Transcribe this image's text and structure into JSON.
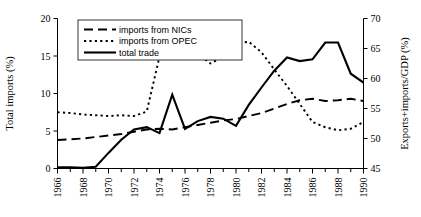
{
  "chart_data": {
    "type": "line",
    "title": "",
    "xlabel": "",
    "ylabel": "Total imports (%)",
    "y2label": "Exports+imports/GDP (%)",
    "grid": false,
    "legend_position": "top-center",
    "x": [
      1966,
      1967,
      1968,
      1969,
      1970,
      1971,
      1972,
      1973,
      1974,
      1975,
      1976,
      1977,
      1978,
      1979,
      1980,
      1981,
      1982,
      1983,
      1984,
      1985,
      1986,
      1987,
      1988,
      1989,
      1990
    ],
    "xlim": [
      1966,
      1990
    ],
    "xticks": [
      1966,
      1968,
      1970,
      1972,
      1974,
      1976,
      1978,
      1980,
      1982,
      1984,
      1986,
      1988,
      1990
    ],
    "xticklabels": [
      "1966",
      "1968",
      "1970",
      "1972",
      "1974",
      "1976",
      "1978",
      "1980",
      "1982",
      "1984",
      "1986",
      "1988",
      "1990"
    ],
    "ylim": [
      0,
      20
    ],
    "yticks": [
      0,
      5,
      10,
      15,
      20
    ],
    "yticklabels": [
      "0",
      "5",
      "10",
      "15",
      "20"
    ],
    "y2lim": [
      45,
      70
    ],
    "y2ticks": [
      45,
      50,
      55,
      60,
      65,
      70
    ],
    "y2ticklabels": [
      "45",
      "50",
      "55",
      "60",
      "65",
      "70"
    ],
    "series": [
      {
        "name": "imports from NICs",
        "style": "dashed",
        "axis": "left",
        "values": [
          3.8,
          3.9,
          4.0,
          4.2,
          4.4,
          4.6,
          4.9,
          5.2,
          5.3,
          5.2,
          5.5,
          5.8,
          6.1,
          6.4,
          6.6,
          7.0,
          7.4,
          8.0,
          8.6,
          9.1,
          9.3,
          9.0,
          9.1,
          9.3,
          9.0
        ]
      },
      {
        "name": "imports from OPEC",
        "style": "dotted",
        "axis": "left",
        "values": [
          7.5,
          7.4,
          7.2,
          7.1,
          7.0,
          7.1,
          7.0,
          7.6,
          14.9,
          15.2,
          15.0,
          15.3,
          14.0,
          14.9,
          16.7,
          16.9,
          15.5,
          13.2,
          11.0,
          8.6,
          6.2,
          5.5,
          5.1,
          5.3,
          6.2
        ]
      },
      {
        "name": "total trade",
        "style": "solid",
        "axis": "right",
        "values": [
          45.2,
          45.2,
          45.1,
          45.3,
          47.6,
          49.8,
          51.5,
          51.9,
          50.9,
          57.3,
          51.6,
          52.9,
          53.6,
          53.3,
          52.1,
          55.6,
          58.5,
          61.3,
          63.5,
          62.9,
          63.2,
          66.0,
          66.0,
          60.8,
          59.3
        ]
      }
    ],
    "legend": [
      {
        "label": "imports from NICs",
        "style": "dashed"
      },
      {
        "label": "imports from OPEC",
        "style": "dotted"
      },
      {
        "label": "total trade",
        "style": "solid"
      }
    ]
  }
}
